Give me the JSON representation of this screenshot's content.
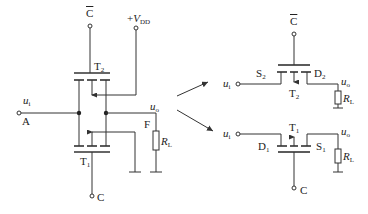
{
  "diagram": {
    "left_circuit": {
      "control_bar": {
        "base": "C",
        "overline": true
      },
      "supply": {
        "prefix": "+",
        "base": "V",
        "sub": "DD"
      },
      "input": {
        "base": "u",
        "sub": "i"
      },
      "input_node": "A",
      "output": {
        "base": "u",
        "sub": "o"
      },
      "output_node": "F",
      "load": {
        "base": "R",
        "sub": "L"
      },
      "upper_transistor": {
        "base": "T",
        "sub": "2"
      },
      "lower_transistor": {
        "base": "T",
        "sub": "1"
      },
      "control": "C"
    },
    "right_top_circuit": {
      "control_bar": {
        "base": "C",
        "overline": true
      },
      "input": {
        "base": "u",
        "sub": "i"
      },
      "source": {
        "base": "S",
        "sub": "2"
      },
      "drain": {
        "base": "D",
        "sub": "2"
      },
      "transistor": {
        "base": "T",
        "sub": "2"
      },
      "output": {
        "base": "u",
        "sub": "o"
      },
      "load": {
        "base": "R",
        "sub": "L"
      }
    },
    "right_bottom_circuit": {
      "control": "C",
      "input": {
        "base": "u",
        "sub": "i"
      },
      "drain": {
        "base": "D",
        "sub": "1"
      },
      "source": {
        "base": "S",
        "sub": "1"
      },
      "transistor": {
        "base": "T",
        "sub": "1"
      },
      "output": {
        "base": "u",
        "sub": "o"
      },
      "load": {
        "base": "R",
        "sub": "L"
      }
    },
    "colors": {
      "line": "#333333",
      "background": "#ffffff"
    }
  }
}
